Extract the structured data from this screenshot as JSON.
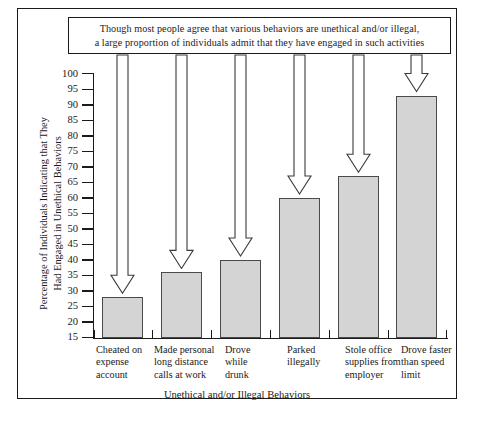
{
  "caption": "Though most people agree that various behaviors are unethical and/or illegal,\na large proportion of individuals admit that  they have engaged in such activities",
  "chart_data": {
    "type": "bar",
    "title": "",
    "caption": "Though most people agree that various behaviors are unethical and/or illegal, a large proportion of individuals admit that they have engaged in such activities",
    "categories": [
      "Cheated on expense account",
      "Made personal long distance calls at work",
      "Drove while drunk",
      "Parked illegally",
      "Stole office supplies from employer",
      "Drove faster than speed limit"
    ],
    "category_lines": [
      "Cheated on\nexpense\naccount",
      "Made personal\nlong distance\ncalls at work",
      "Drove\nwhile\ndrunk",
      "Parked\nillegally",
      "Stole office\nsupplies from\nemployer",
      "Drove faster\nthan speed\nlimit"
    ],
    "values": [
      28,
      36,
      40,
      60,
      67,
      93
    ],
    "xlabel": "Unethical and/or Illegal Behaviors",
    "ylabel": "Percentage of Individuals Indicating that They\nHad Engaged in Unethical Behaviors",
    "ylim": [
      15,
      100
    ],
    "ytick_step": 5,
    "yticks": [
      15,
      20,
      25,
      30,
      35,
      40,
      45,
      50,
      55,
      60,
      65,
      70,
      75,
      80,
      85,
      90,
      95,
      100
    ],
    "grid": false,
    "legend": false,
    "bar_fill_color": "#d4d4d4",
    "bar_edge_color": "#4a4a4a",
    "axis_color": "#1a1a1a",
    "background_color": "#ffffff",
    "annotation": "Six hollow block arrows drop from the caption box to the top of each bar"
  }
}
